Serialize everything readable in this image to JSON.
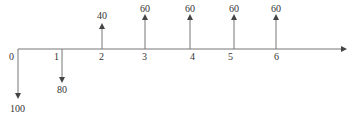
{
  "diagram": {
    "type": "cash-flow-diagram",
    "axis_color": "#777777",
    "periods": [
      {
        "label": "0",
        "x": 18,
        "label_x": 12
      },
      {
        "label": "1",
        "x": 62,
        "label_x": 56
      },
      {
        "label": "2",
        "x": 102,
        "label_x": 102
      },
      {
        "label": "3",
        "x": 145,
        "label_x": 145
      },
      {
        "label": "4",
        "x": 190,
        "label_x": 193
      },
      {
        "label": "5",
        "x": 234,
        "label_x": 231
      },
      {
        "label": "6",
        "x": 276,
        "label_x": 277
      }
    ],
    "cash_flows": [
      {
        "period": "0",
        "value": "100",
        "direction": "down"
      },
      {
        "period": "1",
        "value": "80",
        "direction": "down"
      },
      {
        "period": "2",
        "value": "40",
        "direction": "up"
      },
      {
        "period": "3",
        "value": "60",
        "direction": "up"
      },
      {
        "period": "4",
        "value": "60",
        "direction": "up"
      },
      {
        "period": "5",
        "value": "60",
        "direction": "up"
      },
      {
        "period": "6",
        "value": "60",
        "direction": "up"
      }
    ]
  }
}
